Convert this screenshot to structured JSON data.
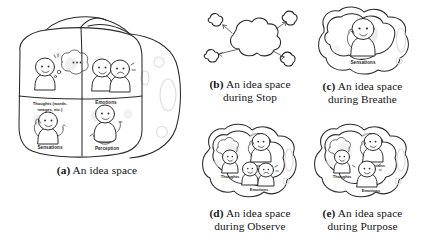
{
  "figure": {
    "background": "#ffffff",
    "ink_color": "#2a2a2a",
    "ghost_color": "#e9e9e9",
    "panels": [
      {
        "id": "a",
        "tag": "(a)",
        "caption_line1": "An idea space",
        "caption_line2": "",
        "kind": "cube-idea-space",
        "quadrant_labels": [
          "Thoughts (words,",
          "images, etc.)",
          "Emotions",
          "Sensations",
          "Perception"
        ],
        "labels": {
          "thoughts_line1": "Thoughts (words,",
          "thoughts_line2": "images, etc.)",
          "emotions": "Emotions",
          "sensations": "Sensations",
          "perception": "Perception"
        }
      },
      {
        "id": "b",
        "tag": "(b)",
        "caption_line1": "An idea space",
        "caption_line2": "during Stop",
        "kind": "cloud-scatter",
        "labels": {}
      },
      {
        "id": "c",
        "tag": "(c)",
        "caption_line1": "An idea space",
        "caption_line2": "during Breathe",
        "kind": "blob-single",
        "labels": {
          "sensations": "Sensations"
        }
      },
      {
        "id": "d",
        "tag": "(d)",
        "caption_line1": "An idea space",
        "caption_line2": "during Observe",
        "kind": "blob-triple",
        "labels": {
          "thoughts": "Thoughts",
          "sensations": "Sensations",
          "emotions": "Emotions"
        }
      },
      {
        "id": "e",
        "tag": "(e)",
        "caption_line1": "An idea space",
        "caption_line2": "during Purpose",
        "kind": "blob-triple",
        "labels": {
          "thoughts": "Thoughts",
          "sensations": "Sensations",
          "emotions": "Emotions"
        }
      }
    ]
  }
}
